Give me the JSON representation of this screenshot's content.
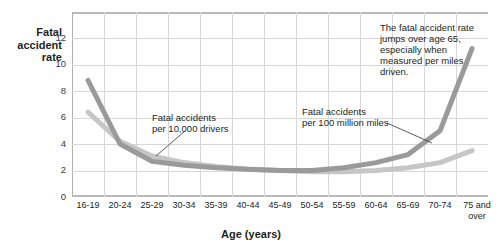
{
  "chart_data": {
    "type": "line",
    "title": "",
    "xlabel": "Age (years)",
    "ylabel": "Fatal accident rate",
    "ylim": [
      0,
      13
    ],
    "yticks": [
      0,
      2,
      4,
      6,
      8,
      10,
      12
    ],
    "grid": true,
    "legend_position": "inline-annotations",
    "categories": [
      "16-19",
      "20-24",
      "25-29",
      "30-34",
      "35-39",
      "40-44",
      "45-49",
      "50-54",
      "55-59",
      "60-64",
      "65-69",
      "70-74",
      "75 and over"
    ],
    "series": [
      {
        "name": "Fatal accidents per 100 million miles",
        "color": "#9a9a9a",
        "values": [
          8.8,
          4.0,
          2.7,
          2.4,
          2.2,
          2.1,
          2.0,
          2.0,
          2.2,
          2.6,
          3.2,
          5.0,
          11.2
        ]
      },
      {
        "name": "Fatal accidents per 10,000 drivers",
        "color": "#c6c6c6",
        "values": [
          6.4,
          4.2,
          3.1,
          2.6,
          2.3,
          2.1,
          2.0,
          1.9,
          1.9,
          2.0,
          2.2,
          2.6,
          3.5
        ]
      }
    ],
    "annotations": [
      {
        "id": "drivers",
        "lines": [
          "Fatal accidents",
          "per 10,000 drivers"
        ]
      },
      {
        "id": "miles",
        "lines": [
          "Fatal accidents",
          "per 100 million miles"
        ]
      },
      {
        "id": "callout",
        "text": "The fatal accident rate jumps over age 65, especially when measured per miles driven."
      }
    ]
  },
  "ylabel_lines": [
    "Fatal",
    "accident",
    "rate"
  ],
  "ytick_labels": [
    "12",
    "10",
    "8",
    "6",
    "4",
    "2",
    "0"
  ],
  "xtick_labels": [
    [
      "16-19"
    ],
    [
      "20-24"
    ],
    [
      "25-29"
    ],
    [
      "30-34"
    ],
    [
      "35-39"
    ],
    [
      "40-44"
    ],
    [
      "45-49"
    ],
    [
      "50-54"
    ],
    [
      "55-59"
    ],
    [
      "60-64"
    ],
    [
      "65-69"
    ],
    [
      "70-74"
    ],
    [
      "75 and",
      "over"
    ]
  ],
  "xaxis_title": "Age (years)",
  "anno_drivers": [
    "Fatal accidents",
    "per 10,000 drivers"
  ],
  "anno_miles": [
    "Fatal accidents",
    "per 100 million miles"
  ],
  "anno_callout": "The fatal accident rate jumps over age 65, especially when measured per miles driven.",
  "colors": {
    "series_miles": "#9a9a9a",
    "series_drivers": "#c6c6c6",
    "grid": "#d8d8d8",
    "frame": "#b9b9b9",
    "text": "#231f20",
    "background": "#ffffff"
  }
}
